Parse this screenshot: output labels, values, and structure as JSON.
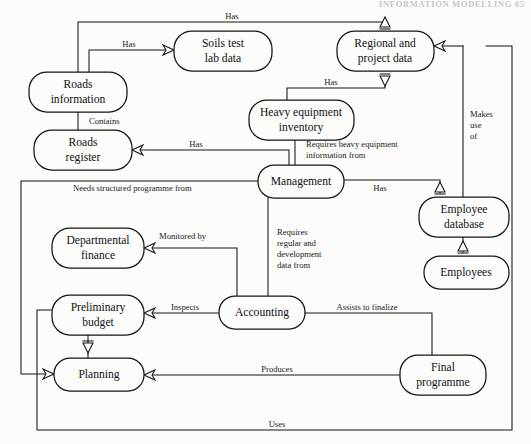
{
  "page": {
    "header_text": "INFORMATION MODELLING  65",
    "background": "#fcfcfa",
    "line_color": "#15150f"
  },
  "nodes": [
    {
      "id": "roads_information",
      "label": "Roads\ninformation",
      "line1": "Roads",
      "line2": "information",
      "x": 29,
      "y": 72,
      "w": 98,
      "h": 40
    },
    {
      "id": "soils_test",
      "label": "Soils test\nlab data",
      "line1": "Soils test",
      "line2": "lab data",
      "x": 174,
      "y": 31,
      "w": 98,
      "h": 40
    },
    {
      "id": "regional_project",
      "label": "Regional and\nproject data",
      "line1": "Regional and",
      "line2": "project data",
      "x": 337,
      "y": 31,
      "w": 97,
      "h": 40
    },
    {
      "id": "roads_register",
      "label": "Roads\nregister",
      "line1": "Roads",
      "line2": "register",
      "x": 34,
      "y": 130,
      "w": 98,
      "h": 40
    },
    {
      "id": "heavy_equipment",
      "label": "Heavy equipment\ninventory",
      "line1": "Heavy equipment",
      "line2": "inventory",
      "x": 249,
      "y": 100,
      "w": 105,
      "h": 40
    },
    {
      "id": "management",
      "label": "Management",
      "line1": "Management",
      "line2": "",
      "x": 258,
      "y": 165,
      "w": 86,
      "h": 33
    },
    {
      "id": "employee_database",
      "label": "Employee\ndatabase",
      "line1": "Employee",
      "line2": "database",
      "x": 419,
      "y": 197,
      "w": 90,
      "h": 40
    },
    {
      "id": "departmental_finance",
      "label": "Departmental\nfinance",
      "line1": "Departmental",
      "line2": "finance",
      "x": 52,
      "y": 228,
      "w": 92,
      "h": 40
    },
    {
      "id": "employees",
      "label": "Employees",
      "line1": "Employees",
      "line2": "",
      "x": 424,
      "y": 256,
      "w": 85,
      "h": 33
    },
    {
      "id": "preliminary_budget",
      "label": "Preliminary\nbudget",
      "line1": "Preliminary",
      "line2": "budget",
      "x": 52,
      "y": 295,
      "w": 92,
      "h": 40
    },
    {
      "id": "accounting",
      "label": "Accounting",
      "line1": "Accounting",
      "line2": "",
      "x": 219,
      "y": 296,
      "w": 86,
      "h": 33
    },
    {
      "id": "planning",
      "label": "Planning",
      "line1": "Planning",
      "line2": "",
      "x": 54,
      "y": 358,
      "w": 90,
      "h": 33
    },
    {
      "id": "final_programme",
      "label": "Final\nprogramme",
      "line1": "Final",
      "line2": "programme",
      "x": 400,
      "y": 355,
      "w": 86,
      "h": 40
    }
  ],
  "edges": [
    {
      "id": "ri_has_rpd",
      "label": "Has",
      "from": "roads_information",
      "to": "regional_project",
      "lx": 232,
      "ly": 24
    },
    {
      "id": "ri_has_stl",
      "label": "Has",
      "from": "roads_information",
      "to": "soils_test",
      "lx": 129,
      "ly": 46
    },
    {
      "id": "ri_contains",
      "label": "Contains",
      "from": "roads_information",
      "to": "roads_register",
      "lx": 89,
      "ly": 121
    },
    {
      "id": "rr_has_mgmt",
      "label": "Has",
      "from": "roads_register",
      "to": "management",
      "lx": 190,
      "ly": 145
    },
    {
      "id": "he_has_rpd",
      "label": "Has",
      "from": "heavy_equipment",
      "to": "regional_project",
      "lx": 331,
      "ly": 83
    },
    {
      "id": "mgmt_req_he",
      "label": "Requires heavy equipment\ninformation from",
      "l1": "Requires heavy equipment",
      "l2": "information from",
      "from": "management",
      "to": "heavy_equipment",
      "lx": 306,
      "ly": 145
    },
    {
      "id": "mgmt_has_ed",
      "label": "Has",
      "from": "management",
      "to": "employee_database",
      "lx": 376,
      "ly": 188
    },
    {
      "id": "rpd_makes_use",
      "label": "Makes\nuse\nof",
      "l1": "Makes",
      "l2": "use",
      "l3": "of",
      "from": "regional_project",
      "to": "employees",
      "lx": 474,
      "ly": 114
    },
    {
      "id": "mgmt_needs",
      "label": "Needs structured programme from",
      "from": "management",
      "to": "planning",
      "lx": 78,
      "ly": 187
    },
    {
      "id": "df_monitored",
      "label": "Monitored by",
      "from": "departmental_finance",
      "to": "accounting",
      "lx": 157,
      "ly": 236
    },
    {
      "id": "mgmt_req_acc",
      "label": "Requires\nregular and\ndevelopment\ndata from",
      "l1": "Requires",
      "l2": "regular and",
      "l3": "development",
      "l4": "data from",
      "from": "management",
      "to": "accounting",
      "lx": 277,
      "ly": 232
    },
    {
      "id": "pb_inspects",
      "label": "Inspects",
      "from": "preliminary_budget",
      "to": "accounting",
      "lx": 167,
      "ly": 310
    },
    {
      "id": "acc_assists",
      "label": "Assists to finalize",
      "from": "accounting",
      "to": "final_programme",
      "lx": 329,
      "ly": 307
    },
    {
      "id": "pl_produces",
      "label": "Produces",
      "from": "planning",
      "to": "final_programme",
      "lx": 257,
      "ly": 368
    },
    {
      "id": "pb_to_pl",
      "label": "",
      "from": "preliminary_budget",
      "to": "planning",
      "lx": 0,
      "ly": 0
    },
    {
      "id": "fp_uses",
      "label": "Uses",
      "from": "final_programme",
      "to": "preliminary_budget",
      "lx": 257,
      "ly": 421
    }
  ]
}
